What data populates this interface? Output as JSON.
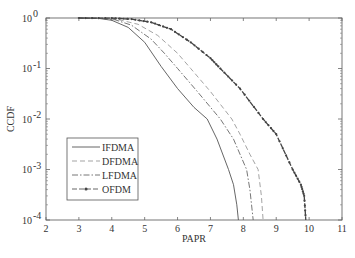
{
  "chart_data": {
    "type": "line",
    "title": "",
    "xlabel": "PAPR",
    "ylabel": "CCDF",
    "xlim": [
      2,
      11
    ],
    "ylim": [
      0.0001,
      1
    ],
    "yscale": "log",
    "grid": false,
    "xticks": [
      "2",
      "3",
      "4",
      "5",
      "6",
      "7",
      "8",
      "9",
      "10",
      "11"
    ],
    "yticks": [
      {
        "base": "10",
        "exp": "0"
      },
      {
        "base": "10",
        "exp": "-1"
      },
      {
        "base": "10",
        "exp": "-2"
      },
      {
        "base": "10",
        "exp": "-3"
      },
      {
        "base": "10",
        "exp": "-4"
      }
    ],
    "legend_position": "lower-left inside",
    "series": [
      {
        "name": "IFDMA",
        "style": "solid",
        "x": [
          3.0,
          3.6,
          4.0,
          4.5,
          5.0,
          5.5,
          6.0,
          6.5,
          6.9,
          7.2,
          7.55,
          7.7,
          7.8,
          7.85
        ],
        "y": [
          1.0,
          0.98,
          0.9,
          0.65,
          0.33,
          0.11,
          0.04,
          0.017,
          0.01,
          0.004,
          0.001,
          0.0005,
          0.0002,
          0.0001
        ]
      },
      {
        "name": "DFDMA",
        "style": "dashed",
        "x": [
          3.0,
          3.8,
          4.2,
          4.8,
          5.4,
          6.0,
          6.4,
          7.0,
          7.65,
          7.9,
          8.2,
          8.45,
          8.55,
          8.6
        ],
        "y": [
          1.0,
          0.98,
          0.93,
          0.75,
          0.45,
          0.2,
          0.1,
          0.035,
          0.01,
          0.005,
          0.002,
          0.001,
          0.0003,
          0.0001
        ]
      },
      {
        "name": "LFDMA",
        "style": "dash-dot",
        "x": [
          3.0,
          3.7,
          4.1,
          4.6,
          5.2,
          5.6,
          6.0,
          6.6,
          7.3,
          7.7,
          8.1,
          8.2,
          8.3
        ],
        "y": [
          1.0,
          0.98,
          0.92,
          0.72,
          0.38,
          0.2,
          0.1,
          0.035,
          0.01,
          0.004,
          0.001,
          0.0004,
          0.0001
        ]
      },
      {
        "name": "OFDM",
        "style": "dashed-marker",
        "x": [
          3.0,
          4.0,
          4.6,
          5.2,
          5.8,
          6.4,
          7.0,
          7.3,
          7.9,
          8.6,
          9.0,
          9.5,
          9.75,
          9.85,
          9.9
        ],
        "y": [
          1.0,
          0.99,
          0.95,
          0.82,
          0.6,
          0.33,
          0.16,
          0.1,
          0.04,
          0.01,
          0.005,
          0.001,
          0.0005,
          0.0003,
          0.0001
        ]
      }
    ]
  },
  "legend": {
    "items": [
      {
        "label": "IFDMA"
      },
      {
        "label": "DFDMA"
      },
      {
        "label": "LFDMA"
      },
      {
        "label": "OFDM"
      }
    ]
  },
  "axes": {
    "xlabel": "PAPR",
    "ylabel": "CCDF"
  }
}
